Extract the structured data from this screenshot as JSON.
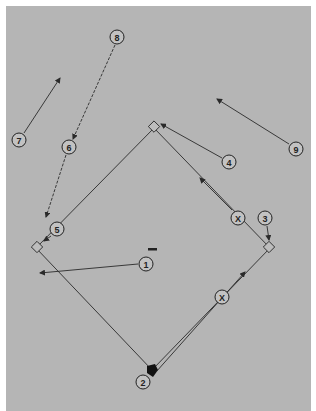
{
  "diagram": {
    "background_color": "#b5b5b5",
    "line_color": "#2a2a2a",
    "bases": {
      "home": {
        "label": "home-plate",
        "x": 152,
        "y": 370
      },
      "first": {
        "label": "first-base",
        "x": 270,
        "y": 248
      },
      "second": {
        "label": "second-base",
        "x": 154,
        "y": 128
      },
      "third": {
        "label": "third-base",
        "x": 36,
        "y": 248
      },
      "pitchers_mound": {
        "label": "pitchers-mound",
        "x": 153,
        "y": 249
      }
    },
    "players": [
      {
        "id": "p1",
        "label": "1",
        "x": 146,
        "y": 264
      },
      {
        "id": "p2",
        "label": "2",
        "x": 143,
        "y": 382
      },
      {
        "id": "p3",
        "label": "3",
        "x": 265,
        "y": 218
      },
      {
        "id": "p4",
        "label": "4",
        "x": 229,
        "y": 162
      },
      {
        "id": "p5",
        "label": "5",
        "x": 57,
        "y": 229
      },
      {
        "id": "p6",
        "label": "6",
        "x": 69,
        "y": 147
      },
      {
        "id": "p7",
        "label": "7",
        "x": 19,
        "y": 140
      },
      {
        "id": "p8",
        "label": "8",
        "x": 117,
        "y": 37
      },
      {
        "id": "p9",
        "label": "9",
        "x": 296,
        "y": 149
      },
      {
        "id": "x1",
        "label": "X",
        "x": 238,
        "y": 218
      },
      {
        "id": "x2",
        "label": "X",
        "x": 222,
        "y": 297
      }
    ],
    "movements": [
      {
        "from": "1",
        "to": "third-base-area",
        "style": "solid"
      },
      {
        "from": "3",
        "to": "first-base",
        "style": "solid"
      },
      {
        "from": "4",
        "to": "second-base",
        "style": "solid"
      },
      {
        "from": "5",
        "to": "third-base",
        "style": "solid"
      },
      {
        "from": "8",
        "to": "6",
        "style": "dashed"
      },
      {
        "from": "6",
        "to": "third-base-area",
        "style": "dashed"
      },
      {
        "from": "7",
        "to": "left-field",
        "style": "solid"
      },
      {
        "from": "9",
        "to": "right-center",
        "style": "solid"
      },
      {
        "from": "X-upper",
        "to": "second-base",
        "style": "solid"
      },
      {
        "from": "home",
        "to": "first-base",
        "style": "solid-runner"
      }
    ]
  }
}
